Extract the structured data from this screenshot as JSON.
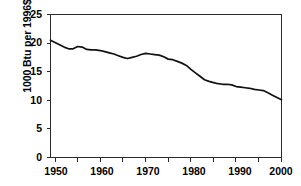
{
  "chart_data": {
    "type": "line",
    "title": "",
    "xlabel": "",
    "ylabel": "1000 Btu per 1996$",
    "xlim": [
      1949,
      2000
    ],
    "ylim": [
      0,
      25
    ],
    "ytick_labels": [
      "25",
      "20",
      "15",
      "10",
      "5",
      "0"
    ],
    "ytick_values": [
      25,
      20,
      15,
      10,
      5,
      0
    ],
    "xtick_labels": [
      "1950",
      "1960",
      "1970",
      "1980",
      "1990",
      "2000"
    ],
    "xtick_values": [
      1950,
      1960,
      1970,
      1980,
      1990,
      2000
    ],
    "xminor_ticks": [
      1955,
      1965,
      1975,
      1985,
      1995
    ],
    "grid": false,
    "legend": false,
    "legend_position": "none",
    "line_color": "#111111",
    "frame_color": "#2b2b2b",
    "series": [
      {
        "name": "Energy intensity",
        "x": [
          1949,
          1950,
          1951,
          1952,
          1953,
          1954,
          1955,
          1956,
          1957,
          1958,
          1959,
          1960,
          1961,
          1962,
          1963,
          1964,
          1965,
          1966,
          1967,
          1968,
          1969,
          1970,
          1971,
          1972,
          1973,
          1974,
          1975,
          1976,
          1977,
          1978,
          1979,
          1980,
          1981,
          1982,
          1983,
          1984,
          1985,
          1986,
          1987,
          1988,
          1989,
          1990,
          1991,
          1992,
          1993,
          1994,
          1995,
          1996,
          1997,
          1998,
          1999,
          2000
        ],
        "values": [
          20.5,
          20.1,
          19.7,
          19.3,
          19.0,
          19.0,
          19.4,
          19.3,
          18.9,
          18.8,
          18.8,
          18.7,
          18.5,
          18.3,
          18.1,
          17.8,
          17.5,
          17.3,
          17.5,
          17.7,
          18.0,
          18.2,
          18.1,
          18.0,
          17.9,
          17.6,
          17.2,
          17.1,
          16.8,
          16.5,
          16.1,
          15.4,
          14.8,
          14.2,
          13.6,
          13.3,
          13.1,
          12.9,
          12.8,
          12.8,
          12.7,
          12.4,
          12.3,
          12.2,
          12.1,
          11.9,
          11.8,
          11.7,
          11.3,
          10.9,
          10.5,
          10.1
        ]
      }
    ]
  },
  "axis": {
    "y_title": "1000 Btu per 1996$"
  }
}
